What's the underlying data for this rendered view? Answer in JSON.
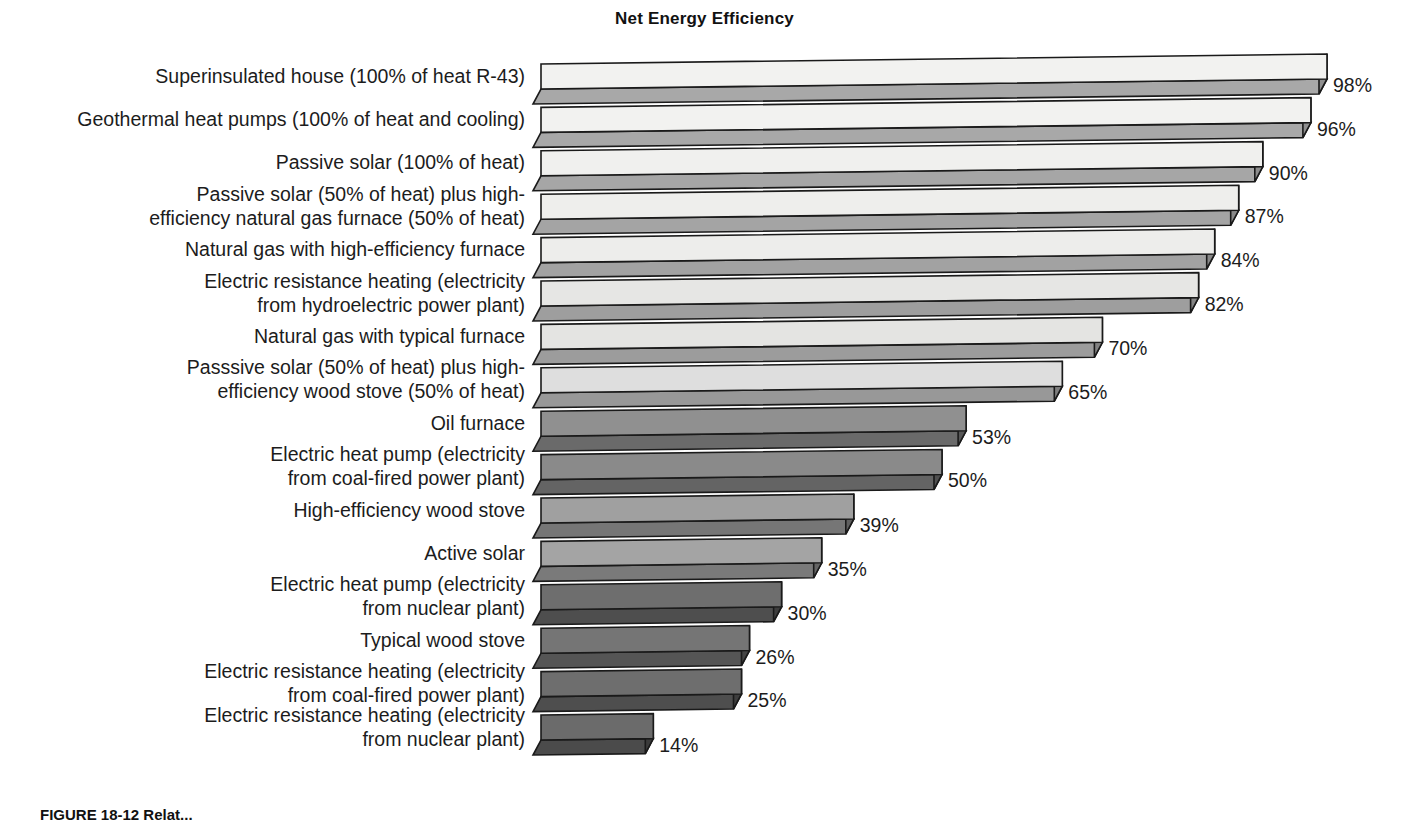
{
  "chart_data": {
    "type": "bar",
    "orientation": "horizontal",
    "style": "3d-isometric-horizontal-bars",
    "title": "Net Energy Efficiency",
    "xlabel": "",
    "ylabel": "",
    "xlim": [
      0,
      100
    ],
    "grid": false,
    "legend": null,
    "value_suffix": "%",
    "categories": [
      "Superinsulated house (100% of heat R-43)",
      "Geothermal heat pumps (100% of heat and cooling)",
      "Passive solar (100% of heat)",
      "Passive solar (50% of heat) plus high-\nefficiency natural gas furnace (50% of heat)",
      "Natural gas with high-efficiency furnace",
      "Electric resistance heating (electricity\nfrom hydroelectric power plant)",
      "Natural gas with typical furnace",
      "Passsive solar (50% of heat) plus high-\nefficiency wood stove (50% of heat)",
      "Oil furnace",
      "Electric heat pump (electricity\nfrom coal-fired power plant)",
      "High-efficiency wood stove",
      "Active solar",
      "Electric heat pump (electricity\nfrom nuclear plant)",
      "Typical wood stove",
      "Electric resistance heating (electricity\nfrom coal-fired power plant)",
      "Electric resistance heating (electricity\nfrom nuclear plant)"
    ],
    "values": [
      98,
      96,
      90,
      87,
      84,
      82,
      70,
      65,
      53,
      50,
      39,
      35,
      30,
      26,
      25,
      14
    ],
    "value_labels": [
      "98%",
      "96%",
      "90%",
      "87%",
      "84%",
      "82%",
      "70%",
      "65%",
      "53%",
      "50%",
      "39%",
      "35%",
      "30%",
      "26%",
      "25%",
      "14%"
    ],
    "bar_colors_top": [
      "#f2f2f0",
      "#f2f2f0",
      "#f0f0ee",
      "#eeeeec",
      "#ededeb",
      "#e6e6e4",
      "#e4e4e2",
      "#dedede",
      "#909090",
      "#8a8a8a",
      "#a0a0a0",
      "#a4a4a4",
      "#6e6e6e",
      "#757575",
      "#6e6e6e",
      "#6b6b6b"
    ],
    "bar_colors_front": [
      "#a8a8a8",
      "#a8a8a8",
      "#a6a6a6",
      "#a4a4a4",
      "#a2a2a2",
      "#9e9e9e",
      "#9c9c9c",
      "#989898",
      "#6a6a6a",
      "#646464",
      "#767676",
      "#7a7a7a",
      "#4e4e4e",
      "#555555",
      "#4e4e4e",
      "#4b4b4b"
    ],
    "bar_colors_side": [
      "#8f8f8f",
      "#8f8f8f",
      "#8d8d8d",
      "#8a8a8a",
      "#888888",
      "#848484",
      "#828282",
      "#7e7e7e",
      "#565656",
      "#505050",
      "#606060",
      "#646464",
      "#3e3e3e",
      "#444444",
      "#3e3e3e",
      "#3b3b3b"
    ]
  },
  "figure": {
    "caption": "FIGURE 18-12  Relat..."
  }
}
